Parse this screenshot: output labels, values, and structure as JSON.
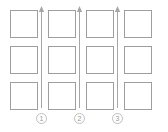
{
  "diagram": {
    "type": "grid-with-progression-arrows",
    "canvas": {
      "width": 168,
      "height": 132,
      "background": "#ffffff"
    },
    "colors": {
      "box_stroke": "#9e9e9e",
      "arrow_stroke": "#a6a6a6",
      "marker_stroke": "#bfbfbf",
      "marker_text": "#9a9a9a",
      "background": "#ffffff"
    },
    "grid": {
      "columns": 4,
      "rows": 3,
      "cell_width": 28,
      "cell_height": 28,
      "column_x": [
        10,
        48,
        86,
        124
      ],
      "row_y": [
        10,
        46,
        82
      ],
      "cells": [
        {
          "row": 0,
          "col": 0,
          "label": ""
        },
        {
          "row": 0,
          "col": 1,
          "label": ""
        },
        {
          "row": 0,
          "col": 2,
          "label": ""
        },
        {
          "row": 0,
          "col": 3,
          "label": ""
        },
        {
          "row": 1,
          "col": 0,
          "label": ""
        },
        {
          "row": 1,
          "col": 1,
          "label": ""
        },
        {
          "row": 1,
          "col": 2,
          "label": ""
        },
        {
          "row": 1,
          "col": 3,
          "label": ""
        },
        {
          "row": 2,
          "col": 0,
          "label": ""
        },
        {
          "row": 2,
          "col": 1,
          "label": ""
        },
        {
          "row": 2,
          "col": 2,
          "label": ""
        },
        {
          "row": 2,
          "col": 3,
          "label": ""
        }
      ]
    },
    "arrows": [
      {
        "id": 1,
        "x": 41,
        "direction": "up",
        "top": 8,
        "bottom": 108,
        "marker_label": "1"
      },
      {
        "id": 2,
        "x": 79,
        "direction": "up",
        "top": 8,
        "bottom": 108,
        "marker_label": "2"
      },
      {
        "id": 3,
        "x": 117,
        "direction": "up",
        "top": 8,
        "bottom": 108,
        "marker_label": "3"
      }
    ],
    "markers": [
      {
        "label": "1",
        "x": 37,
        "y": 113
      },
      {
        "label": "2",
        "x": 75,
        "y": 113
      },
      {
        "label": "3",
        "x": 113,
        "y": 113
      }
    ]
  }
}
